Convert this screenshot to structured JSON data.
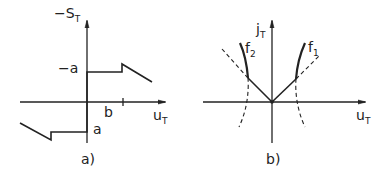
{
  "panel_a": {
    "caption": "a)",
    "y_axis_label": "−S",
    "y_axis_sub": "T",
    "x_axis_label": "u",
    "x_axis_sub": "T",
    "level_upper_label": "−a",
    "level_lower_label": "a",
    "tick_label": "b"
  },
  "panel_b": {
    "caption": "b)",
    "y_axis_label": "j",
    "y_axis_sub": "T",
    "x_axis_label": "u",
    "x_axis_sub": "T",
    "curve_right_label": "f",
    "curve_right_sub": "1",
    "curve_left_label": "f",
    "curve_left_sub": "2"
  }
}
